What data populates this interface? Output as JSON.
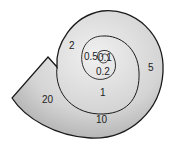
{
  "diagram": {
    "type": "logarithmic spiral",
    "shape_color": "#c9c9c9",
    "outline_color": "#1a1a1a",
    "labels": [
      {
        "id": "0.1",
        "text": "0.1",
        "x": 98,
        "y": 53
      },
      {
        "id": "0.2",
        "text": "0.2",
        "x": 96,
        "y": 67
      },
      {
        "id": "0.5",
        "text": "0.5",
        "x": 84,
        "y": 52
      },
      {
        "id": "1",
        "text": "1",
        "x": 100,
        "y": 88
      },
      {
        "id": "2",
        "text": "2",
        "x": 69,
        "y": 41
      },
      {
        "id": "5",
        "text": "5",
        "x": 148,
        "y": 63
      },
      {
        "id": "10",
        "text": "10",
        "x": 96,
        "y": 115
      },
      {
        "id": "20",
        "text": "20",
        "x": 42,
        "y": 95
      }
    ]
  }
}
